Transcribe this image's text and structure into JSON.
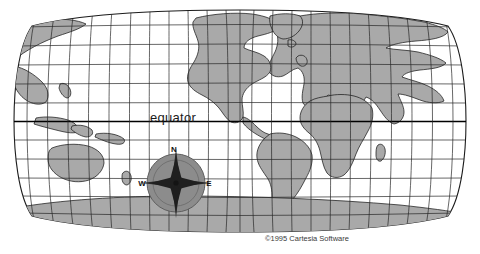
{
  "figure": {
    "kind": "world-map",
    "projection": "robinson-style elliptical world projection",
    "title": "",
    "background_color": "#ffffff"
  },
  "map": {
    "land_color": "#a9a9a9",
    "ocean_color": "#ffffff",
    "outline_color": "#1c1c1c",
    "graticule_color": "#262626",
    "equator_color": "#000000",
    "bounds": {
      "left": 20,
      "top": 10,
      "right": 460,
      "bottom": 232
    }
  },
  "labels": {
    "equator": "equator",
    "equator_position": {
      "x": 150,
      "y": 122
    }
  },
  "compass": {
    "name": "compass-rose",
    "center": {
      "x": 176,
      "y": 183
    },
    "radius": 29,
    "disc_color": "#8c8c8c",
    "star_dark_color": "#1f1f1f",
    "star_light_color": "#6e6e6e",
    "points": [
      {
        "dir": "N",
        "label": "N",
        "x": 174,
        "y": 152
      },
      {
        "dir": "W",
        "label": "W",
        "x": 142,
        "y": 185
      },
      {
        "dir": "E",
        "label": "E",
        "x": 209,
        "y": 185
      },
      {
        "dir": "S",
        "label": "",
        "x": 176,
        "y": 216
      }
    ]
  },
  "graticule": {
    "parallel_count": 12,
    "meridian_count": 23,
    "parallel_spacing_deg": 15,
    "meridian_spacing_deg": 15
  },
  "credit": {
    "text": "©1995 Cartesia Software",
    "position": {
      "x": 265,
      "y": 240
    }
  }
}
